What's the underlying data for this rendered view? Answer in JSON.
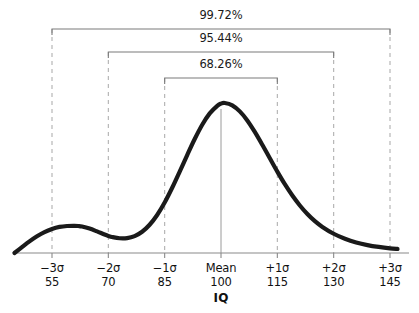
{
  "chart_data": {
    "type": "line",
    "title": "",
    "subtitle": "",
    "xlabel": "IQ",
    "ylabel": "",
    "xlim": [
      44.5,
      147.5
    ],
    "ylim": [
      0,
      1.06
    ],
    "grid": false,
    "legend": null,
    "x_ticks": [
      {
        "sigma": "−3σ",
        "value": "55"
      },
      {
        "sigma": "−2σ",
        "value": "70"
      },
      {
        "sigma": "−1σ",
        "value": "85"
      },
      {
        "sigma": "Mean",
        "value": "100"
      },
      {
        "sigma": "+1σ",
        "value": "115"
      },
      {
        "sigma": "+2σ",
        "value": "130"
      },
      {
        "sigma": "+3σ",
        "value": "145"
      }
    ],
    "x_tick_numeric": [
      55,
      70,
      85,
      100,
      115,
      130,
      145
    ],
    "annotations": [
      {
        "name": "three-sigma-span",
        "label": "99.72%",
        "from": 55,
        "to": 145
      },
      {
        "name": "two-sigma-span",
        "label": "95.44%",
        "from": 70,
        "to": 130
      },
      {
        "name": "one-sigma-span",
        "label": "68.26%",
        "from": 85,
        "to": 115
      }
    ],
    "series": [
      {
        "name": "IQ distribution",
        "comment": "Bimodal density: small secondary bump near IQ 62, dominant mode at IQ 100",
        "x": [
          45.0,
          47.0,
          49.0,
          51.0,
          53.0,
          55.0,
          57.0,
          59.0,
          61.0,
          62.0,
          63.0,
          65.0,
          67.0,
          69.0,
          70.0,
          71.0,
          73.0,
          75.0,
          77.0,
          79.0,
          81.0,
          83.0,
          85.0,
          87.0,
          89.0,
          91.0,
          93.0,
          95.0,
          97.0,
          99.0,
          100.0,
          101.0,
          103.0,
          105.0,
          107.0,
          109.0,
          111.0,
          113.0,
          115.0,
          117.0,
          119.0,
          121.0,
          123.0,
          125.0,
          127.0,
          130.0,
          133.0,
          136.0,
          139.0,
          142.0,
          145.0,
          147.0
        ],
        "y": [
          0.0,
          0.038,
          0.075,
          0.108,
          0.135,
          0.155,
          0.168,
          0.174,
          0.175,
          0.174,
          0.171,
          0.158,
          0.139,
          0.119,
          0.11,
          0.103,
          0.095,
          0.096,
          0.109,
          0.137,
          0.182,
          0.245,
          0.325,
          0.42,
          0.524,
          0.631,
          0.734,
          0.826,
          0.899,
          0.948,
          0.962,
          0.966,
          0.951,
          0.912,
          0.854,
          0.78,
          0.697,
          0.61,
          0.524,
          0.443,
          0.37,
          0.306,
          0.251,
          0.205,
          0.168,
          0.124,
          0.092,
          0.068,
          0.051,
          0.039,
          0.03,
          0.026
        ]
      }
    ],
    "style": {
      "curve_color": "#1a1a1a",
      "curve_width_px": 4.2,
      "axis_color": "#8a8a8a",
      "dashed_guide_color": "#b0b0b0",
      "bracket_color": "#7a7a7a",
      "mean_line_color": "#9a9a9a",
      "background": "#ffffff"
    }
  }
}
